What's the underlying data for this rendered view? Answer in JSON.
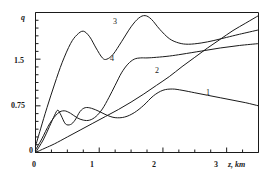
{
  "figure": {
    "background_color": "#ffffff",
    "line_color": "#1a1a1a",
    "axis_color": "#1a1a1a"
  },
  "axes": {
    "y_axis_title": "q",
    "x_axis_title": "z, km",
    "y_tick_labels": [
      "0",
      "0.75",
      "1.5"
    ],
    "x_tick_labels": [
      "0",
      "1",
      "2",
      "3"
    ]
  },
  "curve_labels": {
    "curve_1": "1",
    "curve_2": "2",
    "curve_3": "3",
    "curve_4": "4"
  },
  "chart_data": {
    "type": "line",
    "title": "",
    "xlabel": "z, km",
    "ylabel": "q",
    "xlim": [
      0,
      3.5
    ],
    "ylim": [
      0,
      2.25
    ],
    "grid": false,
    "legend": "inline-curve-numbers",
    "x_ticks_major": [
      0,
      1,
      2,
      3
    ],
    "x_ticks_minor": [
      0.25,
      0.5,
      0.75,
      1.25,
      1.5,
      1.75,
      2.25,
      2.5,
      2.75,
      3.25,
      3.5
    ],
    "y_ticks_major": [
      0,
      0.75,
      1.5
    ],
    "y_ticks_minor": [
      0.125,
      0.25,
      0.375,
      0.5,
      0.625,
      0.875,
      1.0,
      1.125,
      1.25,
      1.375,
      1.625,
      1.75,
      1.875,
      2.0,
      2.125,
      2.25
    ],
    "series": [
      {
        "name": "1",
        "label_position": {
          "x": 2.85,
          "y": 0.95
        },
        "x": [
          0,
          0.12,
          0.22,
          0.3,
          0.35,
          0.4,
          0.47,
          0.55,
          0.62,
          0.7,
          0.78,
          0.88,
          1.0,
          1.12,
          1.25,
          1.4,
          1.55,
          1.7,
          1.85,
          2.0,
          2.15,
          2.3,
          2.5,
          2.7,
          2.9,
          3.1,
          3.3,
          3.5
        ],
        "y": [
          0,
          0.2,
          0.42,
          0.6,
          0.68,
          0.6,
          0.46,
          0.45,
          0.52,
          0.66,
          0.72,
          0.71,
          0.66,
          0.6,
          0.56,
          0.57,
          0.64,
          0.76,
          0.91,
          1.0,
          1.02,
          1.0,
          0.96,
          0.92,
          0.88,
          0.84,
          0.8,
          0.75
        ]
      },
      {
        "name": "2",
        "label_position": {
          "x": 2.02,
          "y": 1.26
        },
        "x": [
          0,
          0.15,
          0.3,
          0.5,
          0.7,
          0.9,
          1.1,
          1.3,
          1.5,
          1.7,
          1.9,
          2.1,
          2.3,
          2.5,
          2.7,
          2.9,
          3.1,
          3.3,
          3.5
        ],
        "y": [
          0,
          0.07,
          0.14,
          0.25,
          0.36,
          0.47,
          0.58,
          0.69,
          0.81,
          0.94,
          1.08,
          1.22,
          1.38,
          1.53,
          1.68,
          1.82,
          1.96,
          2.08,
          2.2
        ]
      },
      {
        "name": "3",
        "label_position": {
          "x": 1.28,
          "y": 2.02
        },
        "x": [
          0,
          0.08,
          0.18,
          0.3,
          0.42,
          0.55,
          0.65,
          0.75,
          0.85,
          0.95,
          1.05,
          1.12,
          1.22,
          1.35,
          1.5,
          1.62,
          1.72,
          1.82,
          1.95,
          2.1,
          2.25,
          2.4,
          2.6,
          2.8,
          3.0,
          3.2,
          3.5
        ],
        "y": [
          0.1,
          0.38,
          0.72,
          1.1,
          1.45,
          1.75,
          1.89,
          1.95,
          1.86,
          1.68,
          1.52,
          1.5,
          1.58,
          1.78,
          2.02,
          2.16,
          2.2,
          2.14,
          1.98,
          1.83,
          1.76,
          1.74,
          1.76,
          1.8,
          1.85,
          1.9,
          1.97
        ]
      },
      {
        "name": "4",
        "label_position": {
          "x": 1.0,
          "y": 1.42
        },
        "x": [
          0,
          0.1,
          0.22,
          0.35,
          0.45,
          0.55,
          0.65,
          0.75,
          0.85,
          0.95,
          1.05,
          1.15,
          1.25,
          1.35,
          1.45,
          1.55,
          1.65,
          1.75,
          1.9,
          2.1,
          2.3,
          2.6,
          2.9,
          3.2,
          3.5
        ],
        "y": [
          0.04,
          0.22,
          0.46,
          0.63,
          0.67,
          0.63,
          0.56,
          0.52,
          0.52,
          0.58,
          0.7,
          0.88,
          1.08,
          1.28,
          1.42,
          1.5,
          1.52,
          1.52,
          1.53,
          1.55,
          1.58,
          1.63,
          1.68,
          1.72,
          1.75
        ]
      }
    ]
  }
}
